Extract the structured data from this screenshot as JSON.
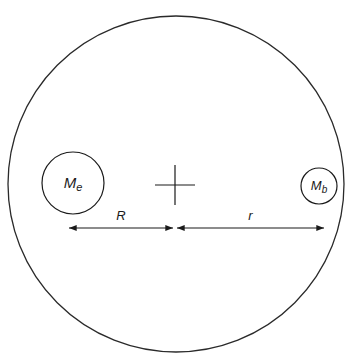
{
  "diagram": {
    "outer_circle": {
      "cx": 176,
      "cy": 184,
      "r": 168,
      "stroke": "#2a2a2a"
    },
    "earth": {
      "label_main": "M",
      "label_sub": "e",
      "cx": 73,
      "cy": 183,
      "r": 31
    },
    "body": {
      "label_main": "M",
      "label_sub": "b",
      "cx": 319,
      "cy": 186,
      "r": 18
    },
    "center_cross": {
      "cx": 175,
      "cy": 185,
      "half": 20
    },
    "dimension_R": {
      "label": "R",
      "x1": 69,
      "x2": 173,
      "y": 228
    },
    "dimension_r": {
      "label": "r",
      "x1": 177,
      "x2": 324,
      "y": 228
    }
  }
}
